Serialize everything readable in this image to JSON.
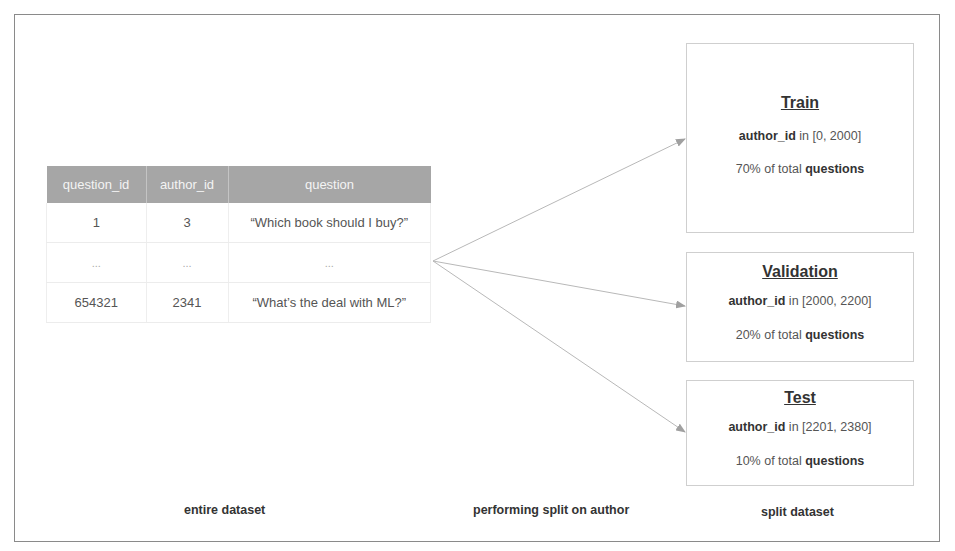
{
  "table": {
    "columns": [
      "question_id",
      "author_id",
      "question"
    ],
    "rows": [
      [
        "1",
        "3",
        "“Which book should I buy?”"
      ],
      [
        "...",
        "...",
        "..."
      ],
      [
        "654321",
        "2341",
        "“What’s the deal with ML?”"
      ]
    ]
  },
  "splits": [
    {
      "name": "Train",
      "range_key": "author_id",
      "range_text": " in [0, 2000]",
      "pct_text": "70% of total ",
      "pct_key": "questions"
    },
    {
      "name": "Validation",
      "range_key": "author_id",
      "range_text": " in [2000, 2200]",
      "pct_text": "20% of total ",
      "pct_key": "questions"
    },
    {
      "name": "Test",
      "range_key": "author_id",
      "range_text": " in [2201, 2380]",
      "pct_text": "10% of total ",
      "pct_key": "questions"
    }
  ],
  "captions": {
    "left": "entire dataset",
    "middle": "performing split on author",
    "right": "split dataset"
  },
  "colors": {
    "header_bg": "#a6a6a6",
    "arrow": "#b0b0b0",
    "frame": "#8a8a8a"
  }
}
